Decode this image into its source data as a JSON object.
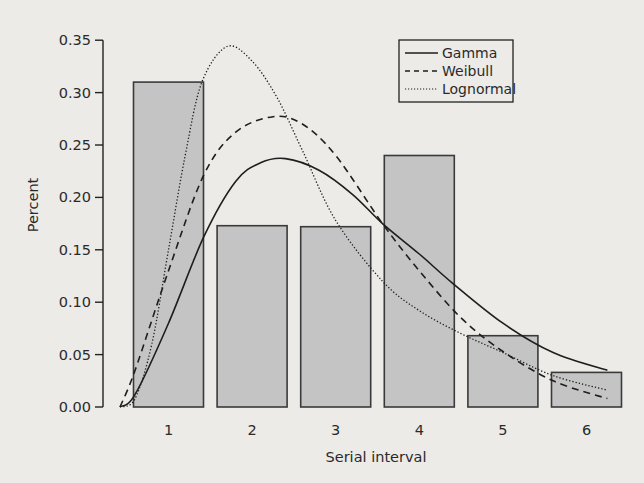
{
  "chart_data": {
    "type": "bar",
    "title": "",
    "xlabel": "Serial interval",
    "ylabel": "Percent",
    "categories": [
      "1",
      "2",
      "3",
      "4",
      "5",
      "6"
    ],
    "values": [
      0.31,
      0.173,
      0.172,
      0.24,
      0.068,
      0.033
    ],
    "ylim": [
      0,
      0.35
    ],
    "yticks": [
      "0.00",
      "0.05",
      "0.10",
      "0.15",
      "0.20",
      "0.25",
      "0.30",
      "0.35"
    ],
    "grid": false,
    "legend_position": "upper right",
    "bar_color": "#c4c4c4",
    "overlay_lines": [
      {
        "name": "Gamma",
        "style": "solid",
        "x": [
          0.42,
          0.6,
          1.0,
          1.42,
          1.8,
          2.1,
          2.4,
          2.8,
          3.2,
          3.56,
          4.0,
          4.4,
          5.0,
          5.6,
          6.25
        ],
        "y": [
          0.0,
          0.012,
          0.08,
          0.162,
          0.215,
          0.233,
          0.237,
          0.226,
          0.203,
          0.175,
          0.146,
          0.118,
          0.08,
          0.052,
          0.035
        ]
      },
      {
        "name": "Weibull",
        "style": "dashed",
        "x": [
          0.42,
          0.6,
          1.0,
          1.42,
          1.8,
          2.25,
          2.6,
          3.0,
          3.56,
          4.0,
          4.5,
          5.0,
          5.6,
          6.25
        ],
        "y": [
          0.0,
          0.035,
          0.13,
          0.221,
          0.262,
          0.277,
          0.27,
          0.24,
          0.175,
          0.13,
          0.085,
          0.053,
          0.025,
          0.008
        ]
      },
      {
        "name": "Lognormal",
        "style": "dotted",
        "x": [
          0.42,
          0.6,
          0.8,
          1.0,
          1.2,
          1.4,
          1.7,
          2.0,
          2.3,
          2.6,
          3.0,
          3.56,
          4.0,
          4.5,
          5.0,
          5.6,
          6.25
        ],
        "y": [
          0.0,
          0.008,
          0.06,
          0.15,
          0.24,
          0.31,
          0.344,
          0.33,
          0.295,
          0.245,
          0.178,
          0.12,
          0.092,
          0.07,
          0.052,
          0.03,
          0.016
        ]
      }
    ]
  },
  "legend": {
    "items": [
      {
        "label": "Gamma",
        "style": "solid"
      },
      {
        "label": "Weibull",
        "style": "dashed"
      },
      {
        "label": "Lognormal",
        "style": "dotted"
      }
    ]
  },
  "axes": {
    "x_title": "Serial interval",
    "y_title": "Percent",
    "x_ticks": [
      "1",
      "2",
      "3",
      "4",
      "5",
      "6"
    ],
    "y_ticks": [
      "0.00",
      "0.05",
      "0.10",
      "0.15",
      "0.20",
      "0.25",
      "0.30",
      "0.35"
    ]
  },
  "colors": {
    "bar_fill": "#c4c4c4",
    "bar_stroke": "#3a3a3a",
    "line": "#1e1e1e",
    "background": "#ecebe8"
  }
}
